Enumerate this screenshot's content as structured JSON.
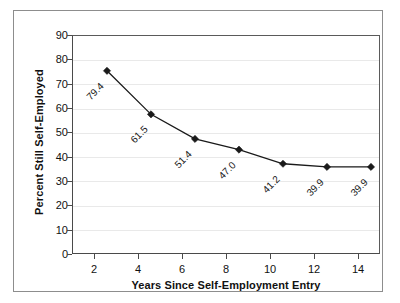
{
  "chart_data": {
    "type": "line",
    "title": "",
    "subtitle": "",
    "xlabel": "Years Since Self-Employment Entry",
    "ylabel": "Percent Still Self-Employed",
    "x": [
      2,
      4,
      6,
      8,
      10,
      12,
      14
    ],
    "values": [
      79.4,
      61.5,
      51.4,
      47.0,
      41.2,
      39.9,
      39.9
    ],
    "point_labels": [
      "79.4",
      "61.5",
      "51.4",
      "47.0",
      "41.2",
      "39.9",
      "39.9"
    ],
    "xtick_labels": [
      "2",
      "4",
      "6",
      "8",
      "10",
      "12",
      "14"
    ],
    "ytick_labels": [
      "0",
      "10",
      "20",
      "30",
      "40",
      "50",
      "60",
      "70",
      "80",
      "90"
    ],
    "yticks": [
      0,
      10,
      20,
      30,
      40,
      50,
      60,
      70,
      80,
      90
    ],
    "xlim": [
      1,
      15
    ],
    "ylim": [
      0,
      90
    ],
    "grid": "horizontal",
    "legend": "none",
    "marker": "diamond",
    "series_color": "#1a1a1a",
    "gridline_color": "#e9e9e9",
    "axis_color": "#4a4a4a",
    "frame_color": "#8d8d8d",
    "background_color": "#ffffff",
    "point_label_rotation_deg": -45
  }
}
